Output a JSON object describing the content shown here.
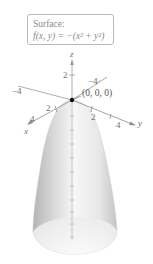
{
  "caption": {
    "title": "Surface:",
    "formula": "f(x, y) = −(x² + y²)"
  },
  "axes": {
    "z": {
      "label": "z",
      "ticks": [
        "2"
      ]
    },
    "x": {
      "label": "x",
      "ticks": [
        "2",
        "4"
      ]
    },
    "y": {
      "label": "y",
      "ticks": [
        "−4",
        "2",
        "4"
      ],
      "neg_tick": "−4"
    },
    "neg_x_tick": "−4"
  },
  "point": {
    "label": "(0, 0, 0)"
  },
  "colors": {
    "surface_light": "#f4f4f4",
    "surface_dark": "#b8b8b8",
    "axis": "#8c8c8c",
    "text": "#6e6e6e",
    "point": "#111111"
  }
}
